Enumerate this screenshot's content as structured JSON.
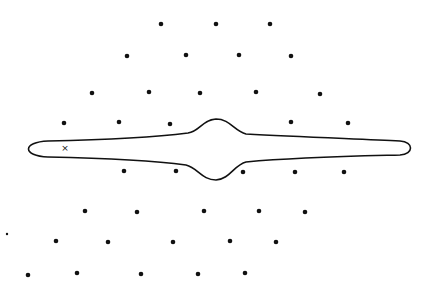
{
  "figure": {
    "width": 433,
    "height": 286,
    "background": "#ffffff",
    "ink_color": "#111111"
  },
  "dots": [
    {
      "x": 161,
      "y": 24
    },
    {
      "x": 216,
      "y": 24
    },
    {
      "x": 270,
      "y": 24
    },
    {
      "x": 127,
      "y": 56
    },
    {
      "x": 186,
      "y": 55
    },
    {
      "x": 239,
      "y": 55
    },
    {
      "x": 291,
      "y": 56
    },
    {
      "x": 92,
      "y": 93
    },
    {
      "x": 149,
      "y": 92
    },
    {
      "x": 200,
      "y": 93
    },
    {
      "x": 256,
      "y": 92
    },
    {
      "x": 320,
      "y": 94
    },
    {
      "x": 64,
      "y": 123
    },
    {
      "x": 119,
      "y": 122
    },
    {
      "x": 170,
      "y": 124
    },
    {
      "x": 291,
      "y": 122
    },
    {
      "x": 348,
      "y": 123
    },
    {
      "x": 124,
      "y": 171
    },
    {
      "x": 176,
      "y": 171
    },
    {
      "x": 243,
      "y": 172
    },
    {
      "x": 295,
      "y": 172
    },
    {
      "x": 344,
      "y": 172
    },
    {
      "x": 85,
      "y": 211
    },
    {
      "x": 137,
      "y": 212
    },
    {
      "x": 204,
      "y": 211
    },
    {
      "x": 259,
      "y": 211
    },
    {
      "x": 305,
      "y": 212
    },
    {
      "x": 56,
      "y": 241
    },
    {
      "x": 108,
      "y": 242
    },
    {
      "x": 173,
      "y": 242
    },
    {
      "x": 230,
      "y": 241
    },
    {
      "x": 276,
      "y": 242
    },
    {
      "x": 28,
      "y": 275
    },
    {
      "x": 77,
      "y": 273
    },
    {
      "x": 141,
      "y": 274
    },
    {
      "x": 198,
      "y": 274
    },
    {
      "x": 245,
      "y": 273
    }
  ],
  "small_dot": {
    "x": 7,
    "y": 234
  },
  "marker": {
    "symbol": "×",
    "x": 65,
    "y": 148
  },
  "contour": {
    "path": "M 48 141 C 100 140, 150 138, 188 133 C 200 131, 202 120, 216 119 C 230 119, 234 131, 246 134 C 300 137, 360 139, 400 141 C 414 142, 414 154, 400 155 C 360 156, 300 157, 246 162 C 234 165, 230 179, 216 180 C 202 180, 198 168, 186 165 C 150 160, 100 158, 48 157 C 22 156, 22 142, 48 141 Z",
    "stroke_width": 1.6
  }
}
